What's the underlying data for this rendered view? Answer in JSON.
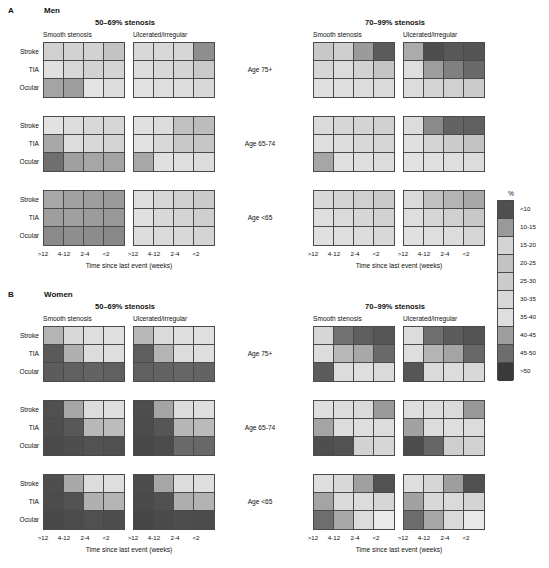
{
  "figure": {
    "row_labels": [
      "Stroke",
      "TIA",
      "Ocular"
    ],
    "column_tick_labels": [
      ">12",
      "4-12",
      "2-4",
      "<2"
    ],
    "axis_title": "Time since last event (weeks)",
    "age_bands": [
      "Age 75+",
      "Age 65-74",
      "Age <65"
    ],
    "stenosis_groups": [
      "50–69% stenosis",
      "70–99% stenosis"
    ],
    "plaque_types": [
      "Smooth stenosis",
      "Ulcerated/irregular"
    ]
  },
  "legend": {
    "title": "%",
    "bands": [
      {
        "label": "<10",
        "color": "#4f4f4f"
      },
      {
        "label": "10-15",
        "color": "#9a9a9a"
      },
      {
        "label": "15-20",
        "color": "#d4d4d4"
      },
      {
        "label": "20-25",
        "color": "#c2c2c2"
      },
      {
        "label": "25-30",
        "color": "#cccccc"
      },
      {
        "label": "30-35",
        "color": "#d8d8d8"
      },
      {
        "label": "35-40",
        "color": "#dedede"
      },
      {
        "label": "40-45",
        "color": "#9e9e9e"
      },
      {
        "label": "45-50",
        "color": "#6d6d6d"
      },
      {
        "label": ">50",
        "color": "#3a3a3a"
      }
    ]
  },
  "panels": [
    {
      "letter": "A",
      "sex": "Men",
      "blocks": [
        {
          "age": "Age 75+",
          "stenosis": "50–69% stenosis",
          "plaque": "Smooth stenosis",
          "values": [
            [
              "#d0d0d0",
              "#d2d2d2",
              "#d2d2d2",
              "#c3c3c3"
            ],
            [
              "#e0e0e0",
              "#d7d7d7",
              "#d2d2d2",
              "#d4d4d4"
            ],
            [
              "#a4a4a4",
              "#9d9d9d",
              "#e3e3e3",
              "#dcdcdc"
            ]
          ]
        },
        {
          "age": "Age 75+",
          "stenosis": "50–69% stenosis",
          "plaque": "Ulcerated/irregular",
          "values": [
            [
              "#d8d8d8",
              "#d8d8d8",
              "#d6d6d6",
              "#8e8e8e"
            ],
            [
              "#dcdcdc",
              "#d8d8d8",
              "#d4d4d4",
              "#c9c9c9"
            ],
            [
              "#e2e2e2",
              "#dedede",
              "#dcdcdc",
              "#d8d8d8"
            ]
          ]
        },
        {
          "age": "Age 75+",
          "stenosis": "70–99% stenosis",
          "plaque": "Smooth stenosis",
          "values": [
            [
              "#c8c8c8",
              "#cfcfcf",
              "#9b9b9b",
              "#5c5c5c"
            ],
            [
              "#d6d6d6",
              "#dcdcdc",
              "#d2d2d2",
              "#c4c4c4"
            ],
            [
              "#e0e0e0",
              "#dedede",
              "#dcdcdc",
              "#dadada"
            ]
          ]
        },
        {
          "age": "Age 75+",
          "stenosis": "70–99% stenosis",
          "plaque": "Ulcerated/irregular",
          "values": [
            [
              "#ababab",
              "#4e4e4e",
              "#585858",
              "#555555"
            ],
            [
              "#dedede",
              "#9d9d9d",
              "#808080",
              "#6a6a6a"
            ],
            [
              "#dcdcdc",
              "#d4d4d4",
              "#d0d0d0",
              "#cbcbcb"
            ]
          ]
        },
        {
          "age": "Age 65-74",
          "stenosis": "50–69% stenosis",
          "plaque": "Smooth stenosis",
          "values": [
            [
              "#e2e2e2",
              "#dcdcdc",
              "#d8d8d8",
              "#d6d6d6"
            ],
            [
              "#a8a8a8",
              "#dcdcdc",
              "#d8d8d8",
              "#d4d4d4"
            ],
            [
              "#6f6f6f",
              "#a0a0a0",
              "#a6a6a6",
              "#a4a4a4"
            ]
          ]
        },
        {
          "age": "Age 65-74",
          "stenosis": "50–69% stenosis",
          "plaque": "Ulcerated/irregular",
          "values": [
            [
              "#e0e0e0",
              "#dcdcdc",
              "#c0c0c0",
              "#bcbcbc"
            ],
            [
              "#e2e2e2",
              "#d8d8d8",
              "#c8c8c8",
              "#c6c6c6"
            ],
            [
              "#a8a8a8",
              "#e0e0e0",
              "#dedede",
              "#dcdcdc"
            ]
          ]
        },
        {
          "age": "Age 65-74",
          "stenosis": "70–99% stenosis",
          "plaque": "Smooth stenosis",
          "values": [
            [
              "#dadada",
              "#d6d6d6",
              "#d4d4d4",
              "#d0d0d0"
            ],
            [
              "#dedede",
              "#dcdcdc",
              "#d8d8d8",
              "#d6d6d6"
            ],
            [
              "#a6a6a6",
              "#e0e0e0",
              "#dedede",
              "#dcdcdc"
            ]
          ]
        },
        {
          "age": "Age 65-74",
          "stenosis": "70–99% stenosis",
          "plaque": "Ulcerated/irregular",
          "values": [
            [
              "#dcdcdc",
              "#8a8a8a",
              "#636363",
              "#606060"
            ],
            [
              "#e0e0e0",
              "#d4d4d4",
              "#cccccc",
              "#c2c2c2"
            ],
            [
              "#e2e2e2",
              "#e0e0e0",
              "#dedede",
              "#dcdcdc"
            ]
          ]
        },
        {
          "age": "Age <65",
          "stenosis": "50–69% stenosis",
          "plaque": "Smooth stenosis",
          "values": [
            [
              "#a8a8a8",
              "#a2a2a2",
              "#9e9e9e",
              "#9a9a9a"
            ],
            [
              "#9e9e9e",
              "#a0a0a0",
              "#9c9c9c",
              "#989898"
            ],
            [
              "#8a8a8a",
              "#8e8e8e",
              "#8c8c8c",
              "#888888"
            ]
          ]
        },
        {
          "age": "Age <65",
          "stenosis": "50–69% stenosis",
          "plaque": "Ulcerated/irregular",
          "values": [
            [
              "#dedede",
              "#d6d6d6",
              "#d0d0d0",
              "#cacaca"
            ],
            [
              "#e0e0e0",
              "#d8d8d8",
              "#d4d4d4",
              "#cecece"
            ],
            [
              "#dcdcdc",
              "#dadada",
              "#d8d8d8",
              "#d4d4d4"
            ]
          ]
        },
        {
          "age": "Age <65",
          "stenosis": "70–99% stenosis",
          "plaque": "Smooth stenosis",
          "values": [
            [
              "#d8d8d8",
              "#d4d4d4",
              "#d0d0d0",
              "#cacaca"
            ],
            [
              "#dedede",
              "#dadada",
              "#d6d6d6",
              "#d2d2d2"
            ],
            [
              "#e0e0e0",
              "#dedede",
              "#dcdcdc",
              "#d8d8d8"
            ]
          ]
        },
        {
          "age": "Age <65",
          "stenosis": "70–99% stenosis",
          "plaque": "Ulcerated/irregular",
          "values": [
            [
              "#dadada",
              "#c0c0c0",
              "#b4b4b4",
              "#a8a8a8"
            ],
            [
              "#dedede",
              "#d6d6d6",
              "#d0d0d0",
              "#c8c8c8"
            ],
            [
              "#e0e0e0",
              "#dedede",
              "#dcdcdc",
              "#d6d6d6"
            ]
          ]
        }
      ]
    },
    {
      "letter": "B",
      "sex": "Women",
      "blocks": [
        {
          "age": "Age 75+",
          "stenosis": "50–69% stenosis",
          "plaque": "Smooth stenosis",
          "values": [
            [
              "#b4b4b4",
              "#d8d8d8",
              "#dedede",
              "#e0e0e0"
            ],
            [
              "#5a5a5a",
              "#b0b0b0",
              "#dcdcdc",
              "#dedede"
            ],
            [
              "#5c5c5c",
              "#606060",
              "#636363",
              "#606060"
            ]
          ]
        },
        {
          "age": "Age 75+",
          "stenosis": "50–69% stenosis",
          "plaque": "Ulcerated/irregular",
          "values": [
            [
              "#b8b8b8",
              "#dadada",
              "#dedede",
              "#e0e0e0"
            ],
            [
              "#5e5e5e",
              "#b4b4b4",
              "#dcdcdc",
              "#dedede"
            ],
            [
              "#606060",
              "#636363",
              "#666666",
              "#636363"
            ]
          ]
        },
        {
          "age": "Age 75+",
          "stenosis": "70–99% stenosis",
          "plaque": "Smooth stenosis",
          "values": [
            [
              "#d6d6d6",
              "#727272",
              "#5e5e5e",
              "#565656"
            ],
            [
              "#dcdcdc",
              "#b8b8b8",
              "#a8a8a8",
              "#6a6a6a"
            ],
            [
              "#5c5c5c",
              "#dcdcdc",
              "#dedede",
              "#dadada"
            ]
          ]
        },
        {
          "age": "Age 75+",
          "stenosis": "70–99% stenosis",
          "plaque": "Ulcerated/irregular",
          "values": [
            [
              "#dcdcdc",
              "#6e6e6e",
              "#5c5c5c",
              "#545454"
            ],
            [
              "#dedede",
              "#b4b4b4",
              "#a4a4a4",
              "#686868"
            ],
            [
              "#565656",
              "#dadada",
              "#dcdcdc",
              "#d8d8d8"
            ]
          ]
        },
        {
          "age": "Age 65-74",
          "stenosis": "50–69% stenosis",
          "plaque": "Smooth stenosis",
          "values": [
            [
              "#505050",
              "#a6a6a6",
              "#dcdcdc",
              "#dedede"
            ],
            [
              "#4e4e4e",
              "#585858",
              "#b8b8b8",
              "#bcbcbc"
            ],
            [
              "#4a4a4a",
              "#4e4e4e",
              "#525252",
              "#505050"
            ]
          ]
        },
        {
          "age": "Age 65-74",
          "stenosis": "50–69% stenosis",
          "plaque": "Ulcerated/irregular",
          "values": [
            [
              "#4e4e4e",
              "#a4a4a4",
              "#dcdcdc",
              "#dedede"
            ],
            [
              "#4c4c4c",
              "#565656",
              "#b6b6b6",
              "#bababa"
            ],
            [
              "#484848",
              "#4c4c4c",
              "#6a6a6a",
              "#686868"
            ]
          ]
        },
        {
          "age": "Age 65-74",
          "stenosis": "70–99% stenosis",
          "plaque": "Smooth stenosis",
          "values": [
            [
              "#dedede",
              "#dcdcdc",
              "#dadada",
              "#9a9a9a"
            ],
            [
              "#a4a4a4",
              "#dcdcdc",
              "#dedede",
              "#dcdcdc"
            ],
            [
              "#4e4e4e",
              "#525252",
              "#d2d2d2",
              "#d6d6d6"
            ]
          ]
        },
        {
          "age": "Age 65-74",
          "stenosis": "70–99% stenosis",
          "plaque": "Ulcerated/irregular",
          "values": [
            [
              "#dedede",
              "#dcdcdc",
              "#dadada",
              "#989898"
            ],
            [
              "#a2a2a2",
              "#dcdcdc",
              "#dedede",
              "#dcdcdc"
            ],
            [
              "#4c4c4c",
              "#666666",
              "#cecece",
              "#d2d2d2"
            ]
          ]
        },
        {
          "age": "Age <65",
          "stenosis": "50–69% stenosis",
          "plaque": "Smooth stenosis",
          "values": [
            [
              "#4e4e4e",
              "#a8a8a8",
              "#dcdcdc",
              "#dedede"
            ],
            [
              "#4c4c4c",
              "#525252",
              "#b0b0b0",
              "#b4b4b4"
            ],
            [
              "#484848",
              "#4c4c4c",
              "#505050",
              "#4e4e4e"
            ]
          ]
        },
        {
          "age": "Age <65",
          "stenosis": "50–69% stenosis",
          "plaque": "Ulcerated/irregular",
          "values": [
            [
              "#4c4c4c",
              "#a6a6a6",
              "#dcdcdc",
              "#dedede"
            ],
            [
              "#4a4a4a",
              "#505050",
              "#aeaeae",
              "#b2b2b2"
            ],
            [
              "#464646",
              "#4a4a4a",
              "#4e4e4e",
              "#4c4c4c"
            ]
          ]
        },
        {
          "age": "Age <65",
          "stenosis": "70–99% stenosis",
          "plaque": "Smooth stenosis",
          "values": [
            [
              "#dedede",
              "#d8d8d8",
              "#a0a0a0",
              "#525252"
            ],
            [
              "#a4a4a4",
              "#dadada",
              "#dcdcdc",
              "#d6d6d6"
            ],
            [
              "#6e6e6e",
              "#a8a8a8",
              "#dcdcdc",
              "#eaeaea"
            ]
          ]
        },
        {
          "age": "Age <65",
          "stenosis": "70–99% stenosis",
          "plaque": "Ulcerated/irregular",
          "values": [
            [
              "#dedede",
              "#d6d6d6",
              "#9e9e9e",
              "#505050"
            ],
            [
              "#a2a2a2",
              "#d8d8d8",
              "#dadada",
              "#d4d4d4"
            ],
            [
              "#6c6c6c",
              "#a6a6a6",
              "#dadada",
              "#e8e8e8"
            ]
          ]
        }
      ]
    }
  ],
  "chart_data": {
    "type": "heatmap",
    "xlabel": "Time since last event (weeks)",
    "ylabel": "",
    "x_categories": [
      ">12",
      "4-12",
      "2-4",
      "<2"
    ],
    "y_categories": [
      "Stroke",
      "TIA",
      "Ocular"
    ],
    "facet_dimensions": {
      "sex": [
        "Men",
        "Women"
      ],
      "age": [
        "Age 75+",
        "Age 65-74",
        "Age <65"
      ],
      "stenosis": [
        "50-69% stenosis",
        "70-99% stenosis"
      ],
      "plaque": [
        "Smooth stenosis",
        "Ulcerated/irregular"
      ]
    },
    "legend_bands": [
      "<10",
      "10-15",
      "15-20",
      "20-25",
      "25-30",
      "30-35",
      "35-40",
      "40-45",
      "45-50",
      ">50"
    ],
    "legend_unit": "%",
    "grid": false
  }
}
